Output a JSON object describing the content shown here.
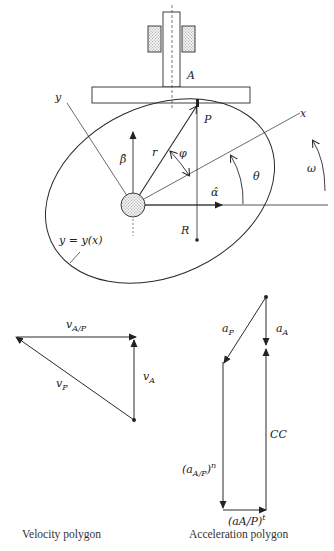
{
  "figure": {
    "mechanism": {
      "follower_label": "A",
      "contact_point_label": "P",
      "x_axis_label": "x",
      "y_axis_label": "y",
      "radius_label": "r",
      "angle_phi_label": "φ",
      "angle_theta_label": "θ",
      "omega_label": "ω",
      "alpha_hat_label": "α̂",
      "beta_hat_label": "β̂",
      "radius_of_curvature_label": "R",
      "cam_profile_label": "y = y(x)"
    },
    "velocity_polygon": {
      "caption": "Velocity polygon",
      "v_AP_base": "v",
      "v_AP_sub": "A/P",
      "v_A_base": "v",
      "v_A_sub": "A",
      "v_P_base": "v",
      "v_P_sub": "P"
    },
    "acceleration_polygon": {
      "caption": "Acceleration polygon",
      "a_P_base": "a",
      "a_P_sub": "P",
      "a_A_base": "a",
      "a_A_sub": "A",
      "cc_label": "CC",
      "a_AP_normal_open": "(a",
      "a_AP_normal_sub": "A/P",
      "a_AP_normal_close": ")",
      "a_AP_normal_sup": "n",
      "a_AP_tangent": "(aA/P)",
      "a_AP_tangent_sup": "t"
    }
  },
  "colors": {
    "line": "#2a2a2a",
    "text": "#222222",
    "stipple": "#9a9a9a",
    "background": "#ffffff"
  }
}
